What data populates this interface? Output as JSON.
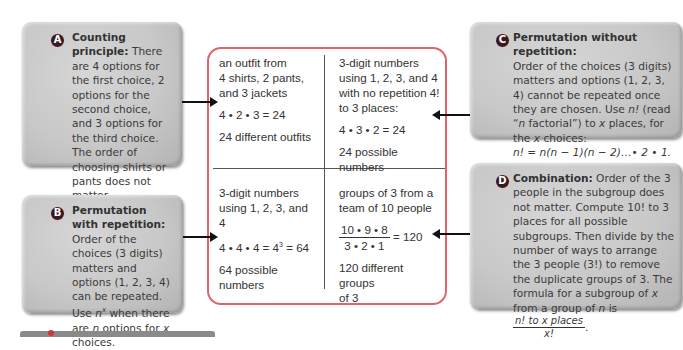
{
  "callouts": {
    "a": {
      "badge": "A",
      "title": "Counting principle:",
      "body": "There are 4 options for the first choice, 2 options for the second choice, and 3 options for the third choice. The order of choosing shirts or pants does not matter."
    },
    "b": {
      "badge": "B",
      "title": "Permutation with repetition:",
      "body_1": " Order of the choices (3 digits) matters and options (1, 2, 3, 4) can be repeated. Use ",
      "n": "n",
      "x_sup": "x",
      "body_2": " when there are ",
      "body_3": " options for ",
      "x": "x",
      "body_4": " choices."
    },
    "c": {
      "badge": "C",
      "title": "Permutation without repetition:",
      "body_1": "Order of the choices (3 digits) matters and options (1, 2, 3, 4) cannot be repeated once they are chosen. Use ",
      "nfact": "n!",
      "body_2": " (read “",
      "n": "n",
      "body_3": " factorial”) to ",
      "x": "x",
      "body_4": " places, for the ",
      "body_5": " choices:",
      "formula": "n! = n(n − 1)(n − 2)…• 2 • 1."
    },
    "d": {
      "badge": "D",
      "title": "Combination:",
      "body_1": " Order of the 3 people in the subgroup does not matter. Compute 10! to 3 places for all possible subgroups. Then divide by the number of ways to arrange the 3 people (3!) to remove the duplicate groups of 3. The formula for a subgroup of ",
      "x": "x",
      "body_2": " from a group of ",
      "n": "n",
      "body_3": " is ",
      "frac_num": "n! to x places",
      "frac_den": "x!",
      "end": "."
    }
  },
  "table": {
    "cell_1": {
      "line_1": "an outfit from",
      "line_2": "4 shirts, 2 pants,",
      "line_3": "and 3 jackets",
      "equation": "4 • 2 • 3 = 24",
      "result": "24 different outfits"
    },
    "cell_2": {
      "line_1": "3-digit numbers",
      "line_2": "using 1, 2, 3, and 4",
      "line_3": "with no repetition 4!",
      "line_4": "to 3 places:",
      "equation": "4 • 3 • 2 = 24",
      "result": "24 possible numbers"
    },
    "cell_3": {
      "line_1": "3-digit numbers",
      "line_2": "using 1, 2, 3, and 4",
      "equation": "4 • 4 • 4 = 4",
      "exp": "3",
      "equation_end": " = 64",
      "result_1": "64 possible",
      "result_2": "numbers"
    },
    "cell_4": {
      "line_1": "groups of 3 from a",
      "line_2": "team of 10 people",
      "frac_num": "10 • 9 • 8",
      "frac_den": "3 • 2 • 1",
      "equals": " = 120",
      "result_1": "120 different groups",
      "result_2": "of 3"
    }
  },
  "colors": {
    "table_border": "#e0646a",
    "badge": "#3b1a1f",
    "callout_bg": "#c8c8c8",
    "arrow": "#111111"
  }
}
